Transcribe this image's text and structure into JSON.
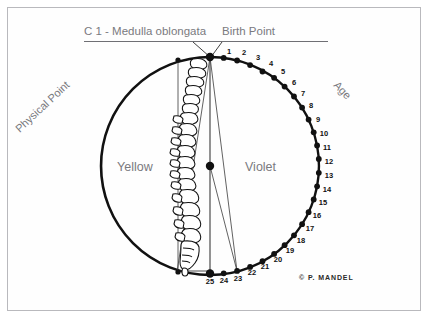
{
  "titles": {
    "c1": "C 1 - Medulla oblongata",
    "birth_point": "Birth Point"
  },
  "labels": {
    "physical_point": "Physical Point",
    "age": "Age",
    "yellow": "Yellow",
    "violet": "Violet"
  },
  "copyright": "© P. MANDEL",
  "colors": {
    "text_gray": "#7a7a7f",
    "ink": "#111111",
    "frame": "#b9b9bd",
    "background": "#ffffff"
  },
  "chart_data": {
    "type": "scatter",
    "grid": false,
    "legend": "none",
    "center": {
      "x": 210,
      "y": 166
    },
    "radius": 109,
    "xlabel": "",
    "ylabel": "",
    "annotations": [
      "C 1 - Medulla oblongata",
      "Birth Point",
      "Physical Point",
      "Age",
      "Yellow",
      "Violet"
    ],
    "regions": [
      {
        "name": "Yellow",
        "side": "left"
      },
      {
        "name": "Violet",
        "side": "right"
      }
    ],
    "categories": [
      "1",
      "2",
      "3",
      "4",
      "5",
      "6",
      "7",
      "8",
      "9",
      "10",
      "11",
      "12",
      "13",
      "14",
      "15",
      "16",
      "17",
      "18",
      "19",
      "20",
      "21",
      "22",
      "23",
      "24",
      "25"
    ],
    "values": [
      1,
      2,
      3,
      4,
      5,
      6,
      7,
      8,
      9,
      10,
      11,
      12,
      13,
      14,
      15,
      16,
      17,
      18,
      19,
      20,
      21,
      22,
      23,
      24,
      25
    ],
    "points": [
      {
        "label": "1",
        "angle_deg": 7.2,
        "x": 223.7,
        "y": 57.9
      },
      {
        "label": "2",
        "angle_deg": 14.4,
        "x": 237.1,
        "y": 60.5
      },
      {
        "label": "3",
        "angle_deg": 21.6,
        "x": 250.1,
        "y": 65.1
      },
      {
        "label": "4",
        "angle_deg": 28.8,
        "x": 262.5,
        "y": 71.5
      },
      {
        "label": "5",
        "angle_deg": 36.0,
        "x": 274.1,
        "y": 77.8
      },
      {
        "label": "6",
        "angle_deg": 43.2,
        "x": 284.6,
        "y": 86.6
      },
      {
        "label": "7",
        "angle_deg": 50.4,
        "x": 294.0,
        "y": 96.5
      },
      {
        "label": "8",
        "angle_deg": 57.6,
        "x": 302.1,
        "y": 107.6
      },
      {
        "label": "9",
        "angle_deg": 64.8,
        "x": 308.6,
        "y": 119.6
      },
      {
        "label": "10",
        "angle_deg": 72.0,
        "x": 313.7,
        "y": 132.3
      },
      {
        "label": "11",
        "angle_deg": 79.2,
        "x": 317.1,
        "y": 145.5
      },
      {
        "label": "12",
        "angle_deg": 86.4,
        "x": 318.8,
        "y": 159.0
      },
      {
        "label": "13",
        "angle_deg": 93.6,
        "x": 318.8,
        "y": 172.8
      },
      {
        "label": "14",
        "angle_deg": 100.8,
        "x": 317.1,
        "y": 186.3
      },
      {
        "label": "15",
        "angle_deg": 108.0,
        "x": 313.7,
        "y": 199.5
      },
      {
        "label": "16",
        "angle_deg": 115.2,
        "x": 308.6,
        "y": 212.2
      },
      {
        "label": "17",
        "angle_deg": 122.4,
        "x": 302.1,
        "y": 224.2
      },
      {
        "label": "18",
        "angle_deg": 129.6,
        "x": 294.0,
        "y": 235.3
      },
      {
        "label": "19",
        "angle_deg": 136.8,
        "x": 284.6,
        "y": 245.2
      },
      {
        "label": "20",
        "angle_deg": 144.0,
        "x": 274.1,
        "y": 253.9
      },
      {
        "label": "21",
        "angle_deg": 151.2,
        "x": 262.5,
        "y": 261.2
      },
      {
        "label": "22",
        "angle_deg": 158.4,
        "x": 250.1,
        "y": 266.9
      },
      {
        "label": "23",
        "angle_deg": 165.6,
        "x": 237.1,
        "y": 270.9
      },
      {
        "label": "24",
        "angle_deg": 172.8,
        "x": 223.7,
        "y": 273.3
      },
      {
        "label": "25",
        "angle_deg": 180.0,
        "x": 210.0,
        "y": 275.0
      }
    ],
    "number_label_positions": [
      {
        "label": "1",
        "x": 229,
        "y": 51
      },
      {
        "label": "2",
        "x": 244,
        "y": 52
      },
      {
        "label": "3",
        "x": 258,
        "y": 57
      },
      {
        "label": "4",
        "x": 271,
        "y": 63
      },
      {
        "label": "5",
        "x": 283,
        "y": 71
      },
      {
        "label": "6",
        "x": 294,
        "y": 82
      },
      {
        "label": "7",
        "x": 303,
        "y": 93
      },
      {
        "label": "8",
        "x": 311,
        "y": 105
      },
      {
        "label": "9",
        "x": 318,
        "y": 119
      },
      {
        "label": "10",
        "x": 324,
        "y": 133
      },
      {
        "label": "11",
        "x": 327,
        "y": 147
      },
      {
        "label": "12",
        "x": 329,
        "y": 161
      },
      {
        "label": "13",
        "x": 329,
        "y": 175
      },
      {
        "label": "14",
        "x": 327,
        "y": 189
      },
      {
        "label": "15",
        "x": 323,
        "y": 202
      },
      {
        "label": "16",
        "x": 317,
        "y": 215
      },
      {
        "label": "17",
        "x": 310,
        "y": 228
      },
      {
        "label": "18",
        "x": 301,
        "y": 240
      },
      {
        "label": "19",
        "x": 290,
        "y": 250
      },
      {
        "label": "20",
        "x": 278,
        "y": 259
      },
      {
        "label": "21",
        "x": 265,
        "y": 266
      },
      {
        "label": "22",
        "x": 252,
        "y": 272
      },
      {
        "label": "23",
        "x": 238,
        "y": 278
      },
      {
        "label": "24",
        "x": 224,
        "y": 280
      },
      {
        "label": "25",
        "x": 210,
        "y": 281
      }
    ],
    "special_points": [
      {
        "name": "Birth Point",
        "x": 210,
        "y": 57
      },
      {
        "name": "Center",
        "x": 210,
        "y": 166
      },
      {
        "name": "Physical Point",
        "x": 133,
        "y": 89
      },
      {
        "name": "C 1 - Medulla oblongata",
        "x": 210,
        "y": 57
      }
    ]
  }
}
